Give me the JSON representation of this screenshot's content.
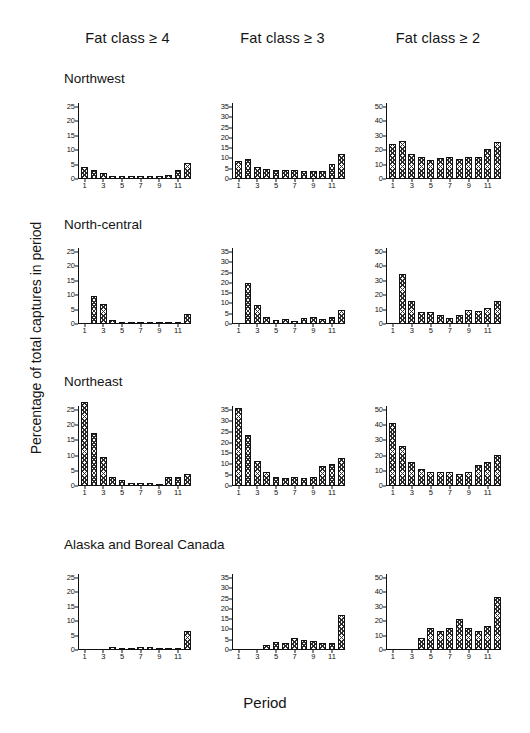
{
  "figure": {
    "ylabel": "Percentage of total captures in period",
    "xlabel": "Period",
    "column_headers": [
      "Fat class ≥ 4",
      "Fat class ≥ 3",
      "Fat class ≥ 2"
    ],
    "row_labels": [
      "Northwest",
      "North-central",
      "Northeast",
      "Alaska and Boreal Canada"
    ],
    "bar_color": "#2b2b2b",
    "axis_color": "#111111"
  },
  "chart_data": [
    {
      "type": "bar",
      "title": "Northwest – Fat class ≥ 4",
      "region": "Northwest",
      "fat_class": "Fat class ≥ 4",
      "xlabel": "Period",
      "ylabel": "Percentage of total captures in period",
      "categories": [
        1,
        2,
        3,
        4,
        5,
        6,
        7,
        8,
        9,
        10,
        11,
        12
      ],
      "values": [
        4.0,
        3.0,
        2.0,
        1.2,
        1.2,
        1.2,
        1.0,
        1.0,
        1.0,
        1.3,
        3.0,
        5.5
      ],
      "ylim": [
        0,
        25
      ],
      "yticks": [
        0,
        5,
        10,
        15,
        20,
        25
      ],
      "xticks": [
        1,
        3,
        5,
        7,
        9,
        11
      ],
      "grid": false
    },
    {
      "type": "bar",
      "title": "Northwest – Fat class ≥ 3",
      "region": "Northwest",
      "fat_class": "Fat class ≥ 3",
      "xlabel": "Period",
      "ylabel": "Percentage of total captures in period",
      "categories": [
        1,
        2,
        3,
        4,
        5,
        6,
        7,
        8,
        9,
        10,
        11,
        12
      ],
      "values": [
        9.0,
        9.5,
        6.0,
        5.0,
        4.5,
        4.5,
        4.5,
        4.0,
        4.0,
        4.0,
        7.5,
        12.0
      ],
      "ylim": [
        0,
        35
      ],
      "yticks": [
        0,
        5,
        10,
        15,
        20,
        25,
        30,
        35
      ],
      "xticks": [
        1,
        3,
        5,
        7,
        9,
        11
      ],
      "grid": false
    },
    {
      "type": "bar",
      "title": "Northwest – Fat class ≥ 2",
      "region": "Northwest",
      "fat_class": "Fat class ≥ 2",
      "xlabel": "Period",
      "ylabel": "Percentage of total captures in period",
      "categories": [
        1,
        2,
        3,
        4,
        5,
        6,
        7,
        8,
        9,
        10,
        11,
        12
      ],
      "values": [
        24.5,
        26.5,
        17.5,
        15.0,
        13.5,
        14.5,
        15.0,
        14.0,
        15.0,
        15.0,
        20.5,
        26.0
      ],
      "ylim": [
        0,
        50
      ],
      "yticks": [
        0,
        10,
        20,
        30,
        40,
        50
      ],
      "xticks": [
        1,
        3,
        5,
        7,
        9,
        11
      ],
      "grid": false
    },
    {
      "type": "bar",
      "title": "North-central – Fat class ≥ 4",
      "region": "North-central",
      "fat_class": "Fat class ≥ 4",
      "xlabel": "Period",
      "ylabel": "Percentage of total captures in period",
      "categories": [
        1,
        2,
        3,
        4,
        5,
        6,
        7,
        8,
        9,
        10,
        11,
        12
      ],
      "values": [
        0.0,
        9.8,
        7.0,
        1.3,
        0.3,
        0.2,
        0.2,
        0.3,
        0.8,
        0.3,
        0.8,
        3.5
      ],
      "ylim": [
        0,
        25
      ],
      "yticks": [
        0,
        5,
        10,
        15,
        20,
        25
      ],
      "xticks": [
        1,
        3,
        5,
        7,
        9,
        11
      ],
      "grid": false
    },
    {
      "type": "bar",
      "title": "North-central – Fat class ≥ 3",
      "region": "North-central",
      "fat_class": "Fat class ≥ 3",
      "xlabel": "Period",
      "ylabel": "Percentage of total captures in period",
      "categories": [
        1,
        2,
        3,
        4,
        5,
        6,
        7,
        8,
        9,
        10,
        11,
        12
      ],
      "values": [
        0.0,
        20.0,
        9.3,
        3.5,
        2.0,
        2.3,
        1.5,
        3.0,
        3.5,
        2.5,
        3.5,
        7.0
      ],
      "ylim": [
        0,
        35
      ],
      "yticks": [
        0,
        5,
        10,
        15,
        20,
        25,
        30,
        35
      ],
      "xticks": [
        1,
        3,
        5,
        7,
        9,
        11
      ],
      "grid": false
    },
    {
      "type": "bar",
      "title": "North-central – Fat class ≥ 2",
      "region": "North-central",
      "fat_class": "Fat class ≥ 2",
      "xlabel": "Period",
      "ylabel": "Percentage of total captures in period",
      "categories": [
        1,
        2,
        3,
        4,
        5,
        6,
        7,
        8,
        9,
        10,
        11,
        12
      ],
      "values": [
        0.0,
        34.5,
        16.0,
        8.0,
        8.0,
        6.0,
        4.5,
        6.0,
        10.0,
        9.0,
        11.0,
        16.0
      ],
      "ylim": [
        0,
        50
      ],
      "yticks": [
        0,
        10,
        20,
        30,
        40,
        50
      ],
      "xticks": [
        1,
        3,
        5,
        7,
        9,
        11
      ],
      "grid": false
    },
    {
      "type": "bar",
      "title": "Northeast – Fat class ≥ 4",
      "region": "Northeast",
      "fat_class": "Fat class ≥ 4",
      "xlabel": "Period",
      "ylabel": "Percentage of total captures in period",
      "categories": [
        1,
        2,
        3,
        4,
        5,
        6,
        7,
        8,
        9,
        10,
        11,
        12
      ],
      "values": [
        27.5,
        17.5,
        9.5,
        3.0,
        2.0,
        1.0,
        1.0,
        1.0,
        0.3,
        3.0,
        3.0,
        4.0
      ],
      "ylim": [
        0,
        25
      ],
      "yticks": [
        0,
        5,
        10,
        15,
        20,
        25
      ],
      "xticks": [
        1,
        3,
        5,
        7,
        9,
        11
      ],
      "grid": false
    },
    {
      "type": "bar",
      "title": "Northeast – Fat class ≥ 3",
      "region": "Northeast",
      "fat_class": "Fat class ≥ 3",
      "xlabel": "Period",
      "ylabel": "Percentage of total captures in period",
      "categories": [
        1,
        2,
        3,
        4,
        5,
        6,
        7,
        8,
        9,
        10,
        11,
        12
      ],
      "values": [
        36.0,
        23.5,
        11.5,
        6.5,
        4.3,
        3.8,
        4.3,
        3.5,
        4.3,
        9.0,
        10.0,
        13.0
      ],
      "ylim": [
        0,
        35
      ],
      "yticks": [
        0,
        5,
        10,
        15,
        20,
        25,
        30,
        35
      ],
      "xticks": [
        1,
        3,
        5,
        7,
        9,
        11
      ],
      "grid": false
    },
    {
      "type": "bar",
      "title": "Northeast – Fat class ≥ 2",
      "region": "Northeast",
      "fat_class": "Fat class ≥ 2",
      "xlabel": "Period",
      "ylabel": "Percentage of total captures in period",
      "categories": [
        1,
        2,
        3,
        4,
        5,
        6,
        7,
        8,
        9,
        10,
        11,
        12
      ],
      "values": [
        41.5,
        26.5,
        16.0,
        11.0,
        9.5,
        9.0,
        9.5,
        8.0,
        9.5,
        13.5,
        15.5,
        20.5
      ],
      "ylim": [
        0,
        50
      ],
      "yticks": [
        0,
        10,
        20,
        30,
        40,
        50
      ],
      "xticks": [
        1,
        3,
        5,
        7,
        9,
        11
      ],
      "grid": false
    },
    {
      "type": "bar",
      "title": "Alaska and Boreal Canada – Fat class ≥ 4",
      "region": "Alaska and Boreal Canada",
      "fat_class": "Fat class ≥ 4",
      "xlabel": "Period",
      "ylabel": "Percentage of total captures in period",
      "categories": [
        1,
        2,
        3,
        4,
        5,
        6,
        7,
        8,
        9,
        10,
        11,
        12
      ],
      "values": [
        0.0,
        0.0,
        0.0,
        1.0,
        0.4,
        0.3,
        1.0,
        1.0,
        0.8,
        0.3,
        0.3,
        6.5
      ],
      "ylim": [
        0,
        25
      ],
      "yticks": [
        0,
        5,
        10,
        15,
        20,
        25
      ],
      "xticks": [
        1,
        3,
        5,
        7,
        9,
        11
      ],
      "grid": false
    },
    {
      "type": "bar",
      "title": "Alaska and Boreal Canada – Fat class ≥ 3",
      "region": "Alaska and Boreal Canada",
      "fat_class": "Fat class ≥ 3",
      "xlabel": "Period",
      "ylabel": "Percentage of total captures in period",
      "categories": [
        1,
        2,
        3,
        4,
        5,
        6,
        7,
        8,
        9,
        10,
        11,
        12
      ],
      "values": [
        0.0,
        0.0,
        0.0,
        2.3,
        4.0,
        3.3,
        5.8,
        5.0,
        4.5,
        3.5,
        3.5,
        17.0
      ],
      "ylim": [
        0,
        35
      ],
      "yticks": [
        0,
        5,
        10,
        15,
        20,
        25,
        30,
        35
      ],
      "xticks": [
        1,
        3,
        5,
        7,
        9,
        11
      ],
      "grid": false
    },
    {
      "type": "bar",
      "title": "Alaska and Boreal Canada – Fat class ≥ 2",
      "region": "Alaska and Boreal Canada",
      "fat_class": "Fat class ≥ 2",
      "xlabel": "Period",
      "ylabel": "Percentage of total captures in period",
      "categories": [
        1,
        2,
        3,
        4,
        5,
        6,
        7,
        8,
        9,
        10,
        11,
        12
      ],
      "values": [
        0.0,
        0.0,
        0.0,
        8.0,
        15.0,
        13.0,
        15.5,
        21.5,
        15.0,
        13.5,
        17.0,
        37.0
      ],
      "ylim": [
        0,
        50
      ],
      "yticks": [
        0,
        10,
        20,
        30,
        40,
        50
      ],
      "xticks": [
        1,
        3,
        5,
        7,
        9,
        11
      ],
      "grid": false
    }
  ]
}
